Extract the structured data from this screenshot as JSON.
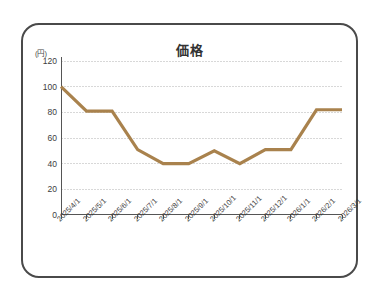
{
  "chart_data": {
    "type": "line",
    "title": "価格",
    "xlabel": "",
    "ylabel": "(円)",
    "ylim": [
      0,
      120
    ],
    "yticks": [
      0,
      20,
      40,
      60,
      80,
      100,
      120
    ],
    "ytick_labels": [
      "0",
      "20",
      "40",
      "60",
      "80",
      "100",
      "120"
    ],
    "grid": true,
    "grid_axis": "y",
    "legend": "none",
    "categories": [
      "2025/4/1",
      "2025/5/1",
      "2025/6/1",
      "2025/7/1",
      "2025/8/1",
      "2025/9/1",
      "2025/10/1",
      "2025/11/1",
      "2025/12/1",
      "2026/1/1",
      "2026/2/1",
      "2026/3/1"
    ],
    "series": [
      {
        "name": "価格",
        "color": "#a9824d",
        "values": [
          100,
          81,
          81,
          51,
          40,
          40,
          50,
          40,
          51,
          51,
          82,
          82
        ]
      }
    ]
  },
  "colors": {
    "line": "#a9824d",
    "axis": "#555555",
    "grid": "#d8d8d8",
    "frame": "#4a4a4a",
    "text": "#3d3d3d"
  }
}
